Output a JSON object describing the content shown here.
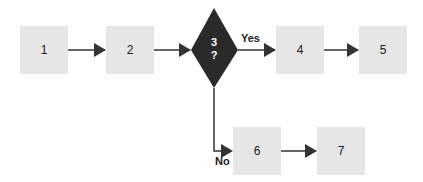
{
  "diagram": {
    "type": "flowchart",
    "nodes": [
      {
        "id": "1",
        "label": "1",
        "shape": "square"
      },
      {
        "id": "2",
        "label": "2",
        "shape": "square"
      },
      {
        "id": "3",
        "label_line1": "3",
        "label_line2": "?",
        "shape": "diamond"
      },
      {
        "id": "4",
        "label": "4",
        "shape": "square"
      },
      {
        "id": "5",
        "label": "5",
        "shape": "square"
      },
      {
        "id": "6",
        "label": "6",
        "shape": "square"
      },
      {
        "id": "7",
        "label": "7",
        "shape": "square"
      }
    ],
    "edges": [
      {
        "from": "1",
        "to": "2"
      },
      {
        "from": "2",
        "to": "3"
      },
      {
        "from": "3",
        "to": "4",
        "label": "Yes"
      },
      {
        "from": "4",
        "to": "5"
      },
      {
        "from": "3",
        "to": "6",
        "label": "No"
      },
      {
        "from": "6",
        "to": "7"
      }
    ],
    "yes_label": "Yes",
    "no_label": "No",
    "colors": {
      "box": "#e6e6e6",
      "diamond": "#2a2a2a",
      "arrow": "#333333"
    }
  }
}
